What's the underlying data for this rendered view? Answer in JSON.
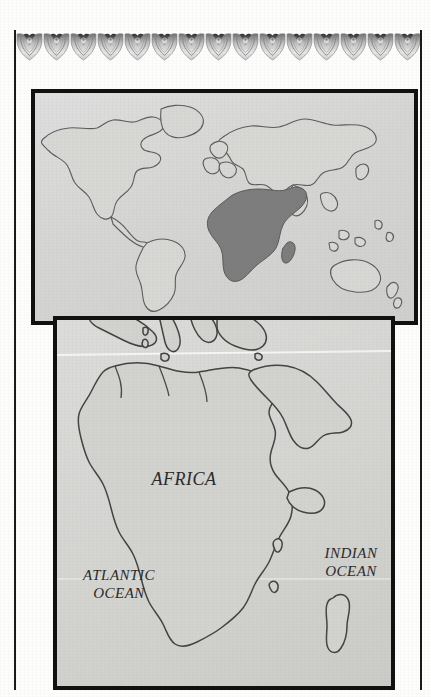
{
  "page": {
    "background_color": "#fdfdfb",
    "rule_color": "#1a1a1a"
  },
  "ornament": {
    "name": "scalloped-heart-frieze",
    "repeat_count": 15,
    "unit_width_px": 27,
    "description": "Engraved repeating scalloped heart-and-crown ornamental border band"
  },
  "world_map": {
    "title": "world-locator-map",
    "ocean_color": "#d6d6d3",
    "land_color": "#d9d9d6",
    "land_outline_color": "#5c5c5c",
    "highlight_region": "Africa",
    "highlight_color": "#7d7d7d",
    "border_color": "#111111"
  },
  "africa_map": {
    "title": "africa-detail-map",
    "sea_color": "#d4d4d1",
    "land_color": "#d2d2cf",
    "coast_outline_color": "#444444",
    "border_color": "#111111",
    "labels": {
      "continent": "AFRICA",
      "atlantic_line1": "ATLANTIC",
      "atlantic_line2": "OCEAN",
      "indian_line1": "INDIAN",
      "indian_line2": "OCEAN"
    }
  }
}
